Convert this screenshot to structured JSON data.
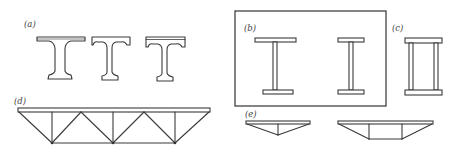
{
  "figure": {
    "panels": [
      {
        "id": "a",
        "label": "(a)",
        "description": "Three rolled/built I and T girder cross-sections with fillets"
      },
      {
        "id": "b",
        "label": "(b)",
        "description": "Two welded plate I-girder cross-sections inside a framed box"
      },
      {
        "id": "c",
        "label": "(c)",
        "description": "Box girder cross-section with two webs"
      },
      {
        "id": "d",
        "label": "(d)",
        "description": "Truss girder elevation with top chord, bottom chord, verticals and diagonals"
      },
      {
        "id": "e",
        "label": "(e)",
        "description": "Two trapezoidal truss/fish-belly girder elevations"
      }
    ]
  },
  "colors": {
    "line": "#3a3a3a",
    "background": "#ffffff",
    "label": "#444444"
  }
}
